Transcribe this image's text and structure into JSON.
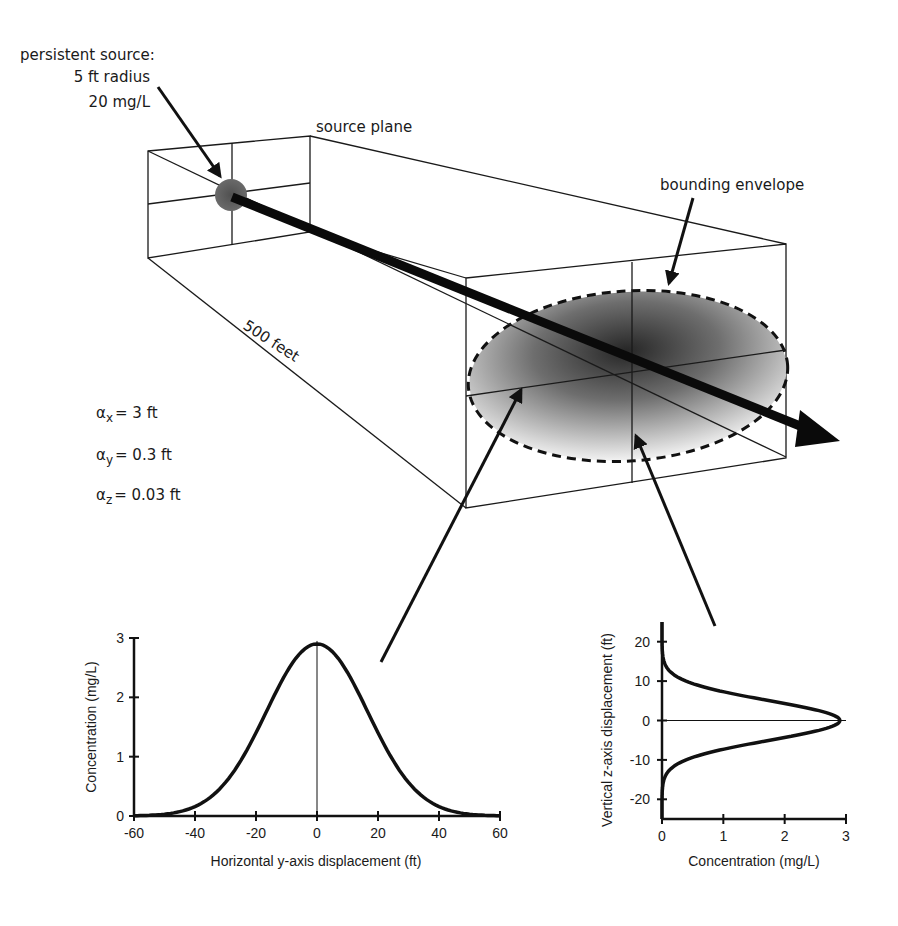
{
  "labels": {
    "source_title": "persistent source:",
    "source_radius": "5 ft radius",
    "source_conc": "20 mg/L",
    "source_plane": "source plane",
    "bounding_envelope": "bounding envelope",
    "distance": "500 feet"
  },
  "dispersivity": [
    {
      "symbol": "α",
      "sub": "x",
      "value": "= 3 ft"
    },
    {
      "symbol": "α",
      "sub": "y",
      "value": "= 0.3 ft"
    },
    {
      "symbol": "α",
      "sub": "z",
      "value": "= 0.03 ft"
    }
  ],
  "colors": {
    "line": "#1a1a1a",
    "source_fill": "#555555",
    "plume_dark": "#2a2a2a",
    "plume_light": "#f4f4f4"
  },
  "chart_data": [
    {
      "type": "line",
      "title": "",
      "xlabel": "Horizontal y-axis displacement (ft)",
      "ylabel": "Concentration (mg/L)",
      "xlim": [
        -60,
        60
      ],
      "ylim": [
        0,
        3
      ],
      "xticks": [
        "-60",
        "-40",
        "-20",
        "0",
        "20",
        "40",
        "60"
      ],
      "yticks": [
        "0",
        "1",
        "2",
        "3"
      ],
      "grid": false,
      "series": [
        {
          "name": "horizontal profile",
          "x": [
            -60,
            -50,
            -40,
            -30,
            -20,
            -10,
            0,
            10,
            20,
            30,
            40,
            50,
            60
          ],
          "y": [
            0.01,
            0.03,
            0.16,
            0.57,
            1.4,
            2.42,
            2.9,
            2.42,
            1.4,
            0.57,
            0.16,
            0.03,
            0.01
          ]
        }
      ]
    },
    {
      "type": "line",
      "title": "",
      "xlabel": "Concentration (mg/L)",
      "ylabel": "Vertical z-axis displacement (ft)",
      "xlim": [
        0,
        3
      ],
      "ylim": [
        -25,
        25
      ],
      "xticks": [
        "0",
        "1",
        "2",
        "3"
      ],
      "yticks": [
        "-20",
        "-10",
        "0",
        "10",
        "20"
      ],
      "grid": false,
      "series": [
        {
          "name": "vertical profile",
          "z": [
            -20,
            -15,
            -10,
            -5,
            0,
            5,
            10,
            15,
            20
          ],
          "concentration": [
            0.0,
            0.03,
            0.39,
            1.76,
            2.9,
            1.76,
            0.39,
            0.03,
            0.0
          ]
        }
      ]
    }
  ]
}
